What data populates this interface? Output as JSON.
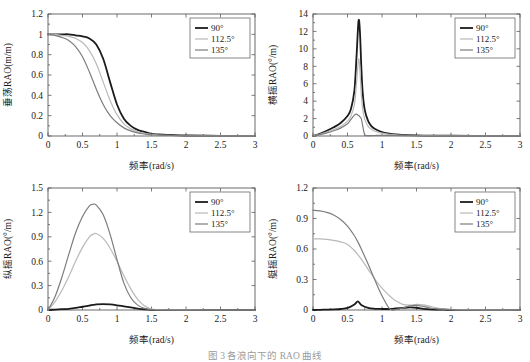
{
  "figure": {
    "caption": "图 3  各浪向下的 RAO 曲线"
  },
  "legend": {
    "entries": [
      {
        "label": "90°",
        "color": "#1b1b1b",
        "width": 1.8
      },
      {
        "label": "112.5°",
        "color": "#b9b9b9",
        "width": 1.2
      },
      {
        "label": "135°",
        "color": "#7d7d7d",
        "width": 1.2
      }
    ]
  },
  "chart_data": [
    {
      "id": "heave",
      "type": "line",
      "title": "",
      "xlabel": "频率(rad/s)",
      "ylabel": "垂荡RAO(m/m)",
      "xlim": [
        0,
        3
      ],
      "ylim": [
        0,
        1.2
      ],
      "xticks": [
        "0",
        "0.5",
        "1",
        "1.5",
        "2",
        "2.5",
        "3"
      ],
      "xtickvals": [
        0,
        0.5,
        1,
        1.5,
        2,
        2.5,
        3
      ],
      "yticks": [
        "0",
        "0.2",
        "0.4",
        "0.6",
        "0.8",
        "1",
        "1.2"
      ],
      "ytickvals": [
        0,
        0.2,
        0.4,
        0.6,
        0.8,
        1.0,
        1.2
      ],
      "grid": false,
      "legend_position": "top-right",
      "x": [
        0,
        0.1,
        0.2,
        0.3,
        0.4,
        0.5,
        0.6,
        0.7,
        0.8,
        0.9,
        1.0,
        1.1,
        1.2,
        1.3,
        1.4,
        1.5,
        1.6,
        1.8,
        2.0,
        2.5,
        3.0
      ],
      "series": [
        {
          "name": "90°",
          "values": [
            1.0,
            1.0,
            1.0,
            1.0,
            0.99,
            0.98,
            0.96,
            0.9,
            0.76,
            0.53,
            0.31,
            0.17,
            0.1,
            0.06,
            0.04,
            0.02,
            0.015,
            0.01,
            0.005,
            0.002,
            0.001
          ]
        },
        {
          "name": "112.5°",
          "values": [
            1.0,
            1.0,
            0.99,
            0.98,
            0.96,
            0.92,
            0.84,
            0.71,
            0.53,
            0.35,
            0.21,
            0.12,
            0.07,
            0.04,
            0.025,
            0.015,
            0.01,
            0.006,
            0.004,
            0.002,
            0.001
          ]
        },
        {
          "name": "135°",
          "values": [
            1.0,
            0.99,
            0.97,
            0.94,
            0.88,
            0.78,
            0.63,
            0.46,
            0.31,
            0.2,
            0.13,
            0.08,
            0.05,
            0.03,
            0.02,
            0.012,
            0.009,
            0.005,
            0.003,
            0.002,
            0.001
          ]
        }
      ]
    },
    {
      "id": "roll",
      "type": "line",
      "title": "",
      "xlabel": "频率(rad/s)",
      "ylabel": "横摇RAO(°/m)",
      "xlim": [
        0,
        3
      ],
      "ylim": [
        0,
        14
      ],
      "xticks": [
        "0",
        "0.5",
        "1",
        "1.5",
        "2",
        "2.5",
        "3"
      ],
      "xtickvals": [
        0,
        0.5,
        1,
        1.5,
        2,
        2.5,
        3
      ],
      "yticks": [
        "0",
        "2",
        "4",
        "6",
        "8",
        "10",
        "12",
        "14"
      ],
      "ytickvals": [
        0,
        2,
        4,
        6,
        8,
        10,
        12,
        14
      ],
      "grid": false,
      "legend_position": "top-right",
      "x": [
        0,
        0.1,
        0.2,
        0.3,
        0.4,
        0.5,
        0.55,
        0.6,
        0.63,
        0.66,
        0.68,
        0.7,
        0.72,
        0.75,
        0.8,
        0.85,
        0.9,
        1.0,
        1.1,
        1.2,
        1.4,
        1.6,
        2.0,
        2.5,
        3.0
      ],
      "series": [
        {
          "name": "90°",
          "values": [
            0.0,
            0.25,
            0.6,
            1.0,
            1.5,
            2.3,
            3.1,
            5.2,
            9.0,
            13.2,
            12.0,
            8.0,
            5.0,
            3.0,
            1.7,
            1.1,
            0.8,
            0.45,
            0.28,
            0.18,
            0.09,
            0.05,
            0.03,
            0.02,
            0.01
          ]
        },
        {
          "name": "112.5°",
          "values": [
            0.0,
            0.2,
            0.45,
            0.75,
            1.1,
            1.7,
            2.3,
            3.6,
            6.0,
            8.8,
            7.5,
            4.8,
            3.1,
            1.9,
            1.1,
            0.75,
            0.55,
            0.32,
            0.2,
            0.13,
            0.07,
            0.04,
            0.02,
            0.015,
            0.01
          ]
        },
        {
          "name": "135°",
          "values": [
            0.0,
            0.15,
            0.35,
            0.6,
            0.9,
            1.4,
            1.9,
            2.4,
            2.5,
            2.35,
            2.2,
            2.0,
            1.2,
            0.15,
            0.05,
            0.05,
            0.06,
            0.08,
            0.08,
            0.06,
            0.04,
            0.03,
            0.02,
            0.01,
            0.01
          ]
        }
      ]
    },
    {
      "id": "pitch",
      "type": "line",
      "title": "",
      "xlabel": "频率(rad/s)",
      "ylabel": "纵摇RAO(°/m)",
      "xlim": [
        0,
        3
      ],
      "ylim": [
        0,
        1.5
      ],
      "xticks": [
        "0",
        "0.5",
        "1",
        "1.5",
        "2",
        "2.5",
        "3"
      ],
      "xtickvals": [
        0,
        0.5,
        1,
        1.5,
        2,
        2.5,
        3
      ],
      "yticks": [
        "0",
        "0.3",
        "0.6",
        "0.9",
        "1.2",
        "1.5"
      ],
      "ytickvals": [
        0,
        0.3,
        0.6,
        0.9,
        1.2,
        1.5
      ],
      "grid": false,
      "legend_position": "top-right",
      "x": [
        0,
        0.1,
        0.2,
        0.3,
        0.4,
        0.5,
        0.6,
        0.65,
        0.7,
        0.8,
        0.9,
        1.0,
        1.1,
        1.2,
        1.3,
        1.4,
        1.5,
        1.7,
        2.0,
        2.5,
        3.0
      ],
      "series": [
        {
          "name": "90°",
          "values": [
            0.0,
            0.005,
            0.01,
            0.015,
            0.025,
            0.04,
            0.055,
            0.062,
            0.068,
            0.072,
            0.068,
            0.058,
            0.045,
            0.032,
            0.018,
            0.008,
            0.002,
            0.001,
            0.0,
            0.0,
            0.0
          ]
        },
        {
          "name": "112.5°",
          "values": [
            0.0,
            0.1,
            0.24,
            0.41,
            0.6,
            0.77,
            0.9,
            0.93,
            0.94,
            0.88,
            0.76,
            0.6,
            0.42,
            0.26,
            0.13,
            0.05,
            0.012,
            0.003,
            0.001,
            0.0,
            0.0
          ]
        },
        {
          "name": "135°",
          "values": [
            0.0,
            0.16,
            0.4,
            0.68,
            0.95,
            1.15,
            1.28,
            1.3,
            1.29,
            1.17,
            0.93,
            0.62,
            0.33,
            0.15,
            0.06,
            0.02,
            0.005,
            0.001,
            0.0,
            0.0,
            0.0
          ]
        }
      ]
    },
    {
      "id": "yaw",
      "type": "line",
      "title": "",
      "xlabel": "频率(rad/s)",
      "ylabel": "艇摇RAO(°/m)",
      "xlim": [
        0,
        3
      ],
      "ylim": [
        0,
        1.2
      ],
      "xticks": [
        "0",
        "0.5",
        "1",
        "1.5",
        "2",
        "2.5",
        "3"
      ],
      "xtickvals": [
        0,
        0.5,
        1,
        1.5,
        2,
        2.5,
        3
      ],
      "yticks": [
        "0",
        "0.3",
        "0.6",
        "0.9",
        "1.2"
      ],
      "ytickvals": [
        0,
        0.3,
        0.6,
        0.9,
        1.2
      ],
      "grid": false,
      "legend_position": "top-right",
      "x": [
        0,
        0.1,
        0.2,
        0.3,
        0.4,
        0.5,
        0.6,
        0.65,
        0.7,
        0.8,
        0.9,
        1.0,
        1.1,
        1.15,
        1.2,
        1.3,
        1.4,
        1.5,
        1.6,
        1.7,
        1.8,
        1.9,
        2.0,
        2.2,
        2.5,
        3.0
      ],
      "series": [
        {
          "name": "90°",
          "values": [
            0.0,
            0.002,
            0.004,
            0.006,
            0.01,
            0.02,
            0.055,
            0.085,
            0.05,
            0.02,
            0.012,
            0.01,
            0.01,
            0.012,
            0.015,
            0.02,
            0.025,
            0.022,
            0.012,
            0.006,
            0.004,
            0.003,
            0.002,
            0.001,
            0.001,
            0.0
          ]
        },
        {
          "name": "112.5°",
          "values": [
            0.7,
            0.7,
            0.695,
            0.685,
            0.67,
            0.645,
            0.585,
            0.545,
            0.5,
            0.4,
            0.3,
            0.215,
            0.145,
            0.115,
            0.09,
            0.055,
            0.048,
            0.055,
            0.05,
            0.035,
            0.02,
            0.01,
            0.006,
            0.003,
            0.001,
            0.0
          ]
        },
        {
          "name": "135°",
          "values": [
            0.98,
            0.975,
            0.96,
            0.935,
            0.89,
            0.825,
            0.73,
            0.67,
            0.6,
            0.45,
            0.29,
            0.14,
            0.02,
            0.0,
            0.005,
            0.02,
            0.04,
            0.045,
            0.035,
            0.02,
            0.012,
            0.008,
            0.004,
            0.002,
            0.001,
            0.0
          ]
        }
      ]
    }
  ]
}
